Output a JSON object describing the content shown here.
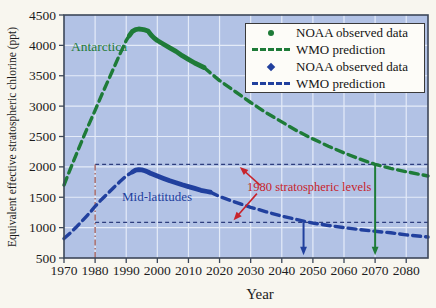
{
  "figure": {
    "background": "#f8f6ef"
  },
  "annotations": {
    "antarctica": "Antarctica",
    "mid_latitudes": "Mid-latitudes",
    "levels_note": "1980 stratospheric levels"
  },
  "legend": {
    "items": [
      {
        "marker": "green-circle",
        "label": "NOAA observed data"
      },
      {
        "marker": "green-dashes",
        "label": "WMO prediction"
      },
      {
        "marker": "blue-diamond",
        "label": "NOAA observed data"
      },
      {
        "marker": "blue-dashes",
        "label": "WMO prediction"
      }
    ]
  },
  "chart_data": {
    "type": "line",
    "title": "",
    "xlabel": "Year",
    "ylabel": "Equivalent effective stratospheric chlorine (ppt)",
    "x_range": [
      1970,
      2087
    ],
    "y_range": [
      500,
      4500
    ],
    "x_ticks": [
      1970,
      1980,
      1990,
      2000,
      2010,
      2020,
      2030,
      2040,
      2050,
      2060,
      2070,
      2080
    ],
    "y_ticks": [
      500,
      1000,
      1500,
      2000,
      2500,
      3000,
      3500,
      4000,
      4500
    ],
    "grid": true,
    "legend_position": "top-right",
    "colors": {
      "green": "#1e7b38",
      "blue": "#21409e",
      "level_line": "#2e3e7e",
      "red": "#c8232b",
      "brick": "#a2625f",
      "grid": "#e4ebf8",
      "plot_bg": "#b2c2e5",
      "frame": "#3c4759",
      "text": "#1c1c1c"
    },
    "series": [
      {
        "id": "antarctica-wmo-prediction-early",
        "name": "WMO prediction (Antarctica)",
        "style": "dashed",
        "color_key": "green",
        "points": [
          [
            1970,
            1700
          ],
          [
            1972,
            1960
          ],
          [
            1974,
            2210
          ],
          [
            1976,
            2460
          ],
          [
            1978,
            2700
          ],
          [
            1980,
            2930
          ],
          [
            1982,
            3170
          ],
          [
            1984,
            3400
          ],
          [
            1986,
            3630
          ],
          [
            1988,
            3860
          ],
          [
            1990,
            4080
          ],
          [
            1991,
            4160
          ]
        ]
      },
      {
        "id": "antarctica-noaa-observed",
        "name": "NOAA observed data (Antarctica)",
        "style": "solid-thick",
        "color_key": "green",
        "points": [
          [
            1991,
            4160
          ],
          [
            1992,
            4230
          ],
          [
            1993,
            4260
          ],
          [
            1994,
            4270
          ],
          [
            1995,
            4265
          ],
          [
            1996,
            4255
          ],
          [
            1997,
            4235
          ],
          [
            1998,
            4170
          ],
          [
            1999,
            4120
          ],
          [
            2000,
            4080
          ],
          [
            2002,
            4020
          ],
          [
            2004,
            3960
          ],
          [
            2006,
            3900
          ],
          [
            2008,
            3830
          ],
          [
            2010,
            3770
          ],
          [
            2012,
            3710
          ],
          [
            2014,
            3660
          ],
          [
            2015,
            3635
          ]
        ]
      },
      {
        "id": "antarctica-wmo-prediction-late",
        "name": "WMO prediction (Antarctica)",
        "style": "dashed",
        "color_key": "green",
        "points": [
          [
            2015,
            3635
          ],
          [
            2020,
            3420
          ],
          [
            2025,
            3240
          ],
          [
            2030,
            3060
          ],
          [
            2035,
            2890
          ],
          [
            2040,
            2740
          ],
          [
            2045,
            2590
          ],
          [
            2050,
            2460
          ],
          [
            2055,
            2340
          ],
          [
            2060,
            2230
          ],
          [
            2065,
            2130
          ],
          [
            2070,
            2040
          ],
          [
            2075,
            1975
          ],
          [
            2080,
            1920
          ],
          [
            2087,
            1850
          ]
        ]
      },
      {
        "id": "midlat-wmo-prediction-early",
        "name": "WMO prediction (Mid-latitudes)",
        "style": "dashed",
        "color_key": "blue",
        "points": [
          [
            1970,
            820
          ],
          [
            1972,
            910
          ],
          [
            1974,
            1010
          ],
          [
            1976,
            1120
          ],
          [
            1978,
            1230
          ],
          [
            1980,
            1350
          ],
          [
            1982,
            1460
          ],
          [
            1984,
            1560
          ],
          [
            1986,
            1660
          ],
          [
            1988,
            1760
          ],
          [
            1990,
            1850
          ],
          [
            1992,
            1915
          ]
        ]
      },
      {
        "id": "midlat-noaa-observed",
        "name": "NOAA observed data (Mid-latitudes)",
        "style": "solid-thick",
        "color_key": "blue",
        "points": [
          [
            1992,
            1915
          ],
          [
            1993,
            1945
          ],
          [
            1994,
            1955
          ],
          [
            1995,
            1950
          ],
          [
            1996,
            1935
          ],
          [
            1997,
            1915
          ],
          [
            1998,
            1890
          ],
          [
            2000,
            1850
          ],
          [
            2002,
            1810
          ],
          [
            2004,
            1770
          ],
          [
            2006,
            1740
          ],
          [
            2008,
            1705
          ],
          [
            2010,
            1675
          ],
          [
            2012,
            1645
          ],
          [
            2014,
            1615
          ],
          [
            2016,
            1595
          ],
          [
            2017,
            1585
          ]
        ]
      },
      {
        "id": "midlat-wmo-prediction-late",
        "name": "WMO prediction (Mid-latitudes)",
        "style": "dashed",
        "color_key": "blue",
        "points": [
          [
            2017,
            1585
          ],
          [
            2020,
            1510
          ],
          [
            2025,
            1420
          ],
          [
            2030,
            1335
          ],
          [
            2035,
            1260
          ],
          [
            2040,
            1190
          ],
          [
            2045,
            1130
          ],
          [
            2050,
            1075
          ],
          [
            2055,
            1035
          ],
          [
            2060,
            1000
          ],
          [
            2065,
            968
          ],
          [
            2070,
            940
          ],
          [
            2075,
            915
          ],
          [
            2080,
            880
          ],
          [
            2087,
            845
          ]
        ]
      }
    ],
    "level_lines": [
      {
        "id": "antarctica-1980-level",
        "value": 2040,
        "from": 1980,
        "to": 2087
      },
      {
        "id": "midlat-1980-level",
        "value": 1085,
        "from": 1980,
        "to": 2087
      }
    ],
    "vertical_line": {
      "id": "year-1980-marker",
      "x": 1980,
      "from": 500,
      "to": 2040
    },
    "arrows": [
      {
        "id": "red-arrow-to-upper-level",
        "color_key": "red",
        "from": [
          2033,
          1700
        ],
        "to": [
          2026.5,
          2000
        ],
        "width": 1.6
      },
      {
        "id": "red-arrow-to-lower-level",
        "color_key": "red",
        "from": [
          2032,
          1560
        ],
        "to": [
          2024.5,
          1120
        ],
        "width": 1.6
      },
      {
        "id": "midlat-recovery-arrow",
        "color_key": "blue",
        "from": [
          2047,
          1085
        ],
        "to": [
          2047,
          545
        ],
        "width": 2
      },
      {
        "id": "antarctica-recovery-arrow",
        "color_key": "green",
        "from": [
          2070,
          2040
        ],
        "to": [
          2070,
          545
        ],
        "width": 2
      }
    ]
  }
}
